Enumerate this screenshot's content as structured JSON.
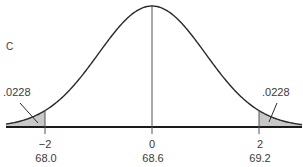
{
  "chart_data": {
    "type": "area",
    "title": "",
    "panel_label": "C",
    "xlabel": "",
    "ylabel": "",
    "distribution": "normal",
    "mean": 68.6,
    "std_dev": 0.3,
    "z_ticks": [
      "−2",
      "0",
      "2"
    ],
    "z_values": [
      -2,
      0,
      2
    ],
    "x_ticks": [
      "68.0",
      "68.6",
      "69.2"
    ],
    "x_values": [
      68.0,
      68.6,
      69.2
    ],
    "shaded_regions": [
      {
        "side": "left",
        "from_z": "-inf",
        "to_z": -2,
        "area": ".0228"
      },
      {
        "side": "right",
        "from_z": 2,
        "to_z": "inf",
        "area": ".0228"
      }
    ],
    "tail_labels": {
      "left": ".0228",
      "right": ".0228"
    },
    "grid": false,
    "legend": "none"
  }
}
